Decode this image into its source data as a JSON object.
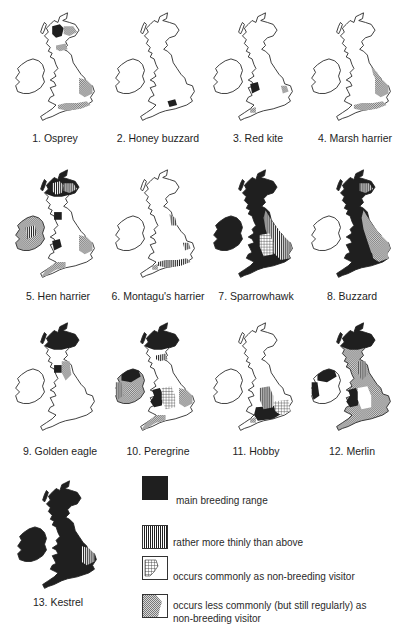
{
  "figure": {
    "maps": [
      {
        "caption": "1. Osprey",
        "species": "Osprey",
        "regions": {
          "main": [
            "scot_central"
          ],
          "thin": [],
          "common_visitor": [],
          "less_common_visitor": [
            "scot_ne",
            "scot_south",
            "east_anglia",
            "south_coast"
          ]
        }
      },
      {
        "caption": "2. Honey buzzard",
        "species": "Honey buzzard",
        "regions": {
          "main": [
            "hampshire"
          ],
          "thin": [],
          "common_visitor": [],
          "less_common_visitor": []
        }
      },
      {
        "caption": "3. Red kite",
        "species": "Red kite",
        "regions": {
          "main": [
            "wales_central"
          ],
          "thin": [],
          "common_visitor": [],
          "less_common_visitor": [
            "east_anglia_small",
            "devon_small"
          ]
        }
      },
      {
        "caption": "4. Marsh harrier",
        "species": "Marsh harrier",
        "regions": {
          "main": [],
          "thin": [],
          "common_visitor": [],
          "less_common_visitor": [
            "east_coast",
            "east_anglia",
            "south_coast"
          ]
        }
      },
      {
        "caption": "5. Hen harrier",
        "species": "Hen harrier",
        "regions": {
          "main": [
            "scot_west",
            "wales_north"
          ],
          "thin": [
            "scot_central",
            "ireland_central"
          ],
          "common_visitor": [],
          "less_common_visitor": [
            "ireland",
            "east_anglia",
            "south_west"
          ]
        }
      },
      {
        "caption": "6. Montagu's harrier",
        "species": "Montagu's harrier",
        "regions": {
          "main": [],
          "thin": [
            "yorkshire",
            "east_anglia_small",
            "south_coast"
          ],
          "common_visitor": [],
          "less_common_visitor": [
            "wales_small",
            "ireland_east"
          ]
        }
      },
      {
        "caption": "7. Sparrowhawk",
        "species": "Sparrowhawk",
        "regions": {
          "main": [
            "all"
          ],
          "thin": [
            "east_england"
          ],
          "common_visitor": [
            "east_midlands"
          ],
          "less_common_visitor": []
        }
      },
      {
        "caption": "8. Buzzard",
        "species": "Buzzard",
        "regions": {
          "main": [
            "scotland",
            "wales",
            "south_west",
            "lake_district"
          ],
          "thin": [
            "scot_east"
          ],
          "common_visitor": [],
          "less_common_visitor": [
            "east_england",
            "midlands"
          ]
        }
      },
      {
        "caption": "9. Golden eagle",
        "species": "Golden eagle",
        "regions": {
          "main": [
            "scotland_highlands",
            "scot_south_small"
          ],
          "thin": [],
          "common_visitor": [],
          "less_common_visitor": [
            "lake_district_small"
          ]
        }
      },
      {
        "caption": "10. Peregrine",
        "species": "Peregrine",
        "regions": {
          "main": [
            "scotland_highlands",
            "wales",
            "ireland_coast",
            "south_west"
          ],
          "thin": [
            "scot_south",
            "ireland_west"
          ],
          "common_visitor": [
            "midlands"
          ],
          "less_common_visitor": [
            "east_anglia",
            "ireland_south"
          ]
        }
      },
      {
        "caption": "11. Hobby",
        "species": "Hobby",
        "regions": {
          "main": [
            "south_central"
          ],
          "thin": [
            "south_central_edge"
          ],
          "common_visitor": [
            "south_east"
          ],
          "less_common_visitor": [
            "south_west_coast"
          ]
        }
      },
      {
        "caption": "12. Merlin",
        "species": "Merlin",
        "regions": {
          "main": [
            "scotland_highlands",
            "ireland_north",
            "wales"
          ],
          "thin": [
            "pennines",
            "ireland_west"
          ],
          "common_visitor": [],
          "less_common_visitor": [
            "east_england",
            "south"
          ]
        }
      },
      {
        "caption": "13. Kestrel",
        "species": "Kestrel",
        "regions": {
          "main": [
            "all"
          ],
          "thin": [
            "east_anglia"
          ],
          "common_visitor": [],
          "less_common_visitor": []
        }
      }
    ],
    "legend": [
      {
        "key": "main",
        "label": "main breeding range"
      },
      {
        "key": "thin",
        "label": "rather more thinly than above"
      },
      {
        "key": "common_visitor",
        "label": "occurs commonly as non-breeding visitor"
      },
      {
        "key": "less_common_visitor",
        "label_line1": "occurs less commonly (but still regularly) as",
        "label_line2": "non-breeding visitor"
      }
    ],
    "colors": {
      "ink": "#1f1f1f",
      "paper": "#ffffff",
      "pattern_gray": "#8a8a8a"
    }
  }
}
